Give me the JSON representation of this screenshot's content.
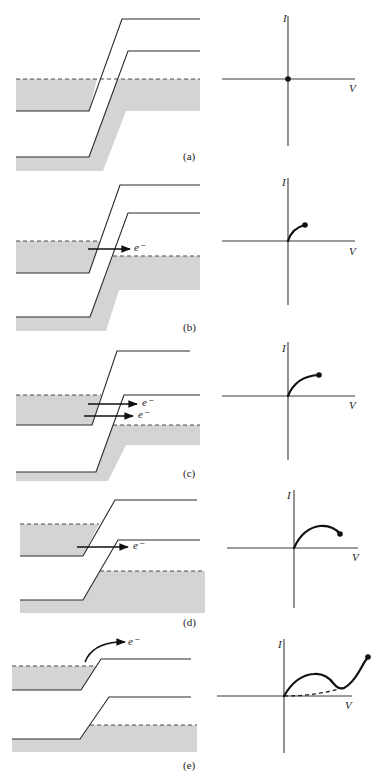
{
  "figure": {
    "axis_labels": {
      "current": "I",
      "voltage": "V"
    },
    "electron_label": "e⁻",
    "colors": {
      "filled_states": "#d4d4d4",
      "lines": "#2a2a2a",
      "curve": "#111111"
    },
    "panels": [
      {
        "label": "(a)",
        "label_pos": [
          183,
          160
        ],
        "fills": [
          "16,79 97,79 89,111 16,111",
          "117,79 200,79 200,111 126,111 103,171 16,171 16,157 89,157"
        ],
        "bands": [
          "16,111 89,111 122,19 200,19",
          "16,157 89,157 128,51 200,51"
        ],
        "fermi": [
          [
            16,
            79,
            200,
            79
          ]
        ],
        "arrows": [],
        "iv": {
          "origin": [
            288,
            79
          ],
          "ytop": 16,
          "ybot": 146,
          "xleft": 222,
          "xright": 355,
          "I_pos": [
            283,
            22
          ],
          "V_pos": [
            349,
            92
          ],
          "curve": "",
          "dot": [
            288,
            79
          ],
          "dashed": ""
        }
      },
      {
        "label": "(b)",
        "label_pos": [
          183,
          331
        ],
        "fills": [
          "16,241 100,241 89,273 16,273",
          "113,256 200,256 200,290 119,290 106,331 16,331 16,317 90,317"
        ],
        "bands": [
          "16,273 89,273 120,185 200,185",
          "16,317 90,317 128,213 200,213"
        ],
        "fermi": [
          [
            16,
            241,
            100,
            241
          ],
          [
            113,
            256,
            200,
            256
          ]
        ],
        "arrows": [
          {
            "x1": 88,
            "y1": 249,
            "x2": 130,
            "y2": 249,
            "tx": 134,
            "ty": 251
          }
        ],
        "iv": {
          "origin": [
            288,
            241
          ],
          "ytop": 178,
          "ybot": 305,
          "xleft": 222,
          "xright": 355,
          "I_pos": [
            282,
            186
          ],
          "V_pos": [
            349,
            255
          ],
          "curve": "M288,241 Q292,228 305,225",
          "dot": [
            305,
            225
          ],
          "dashed": ""
        }
      },
      {
        "label": "(c)",
        "label_pos": [
          183,
          477
        ],
        "fills": [
          "16,395 101,395 92,425 16,425",
          "113,425 200,425 200,445 126,445 108,481 16,481 16,472 96,472"
        ],
        "bands": [
          "16,425 92,425 117,351 190,351",
          "16,472 96,472 124,395 200,395"
        ],
        "fermi": [
          [
            16,
            395,
            101,
            395
          ],
          [
            113,
            425,
            200,
            425
          ]
        ],
        "arrows": [
          {
            "x1": 88,
            "y1": 404,
            "x2": 137,
            "y2": 404,
            "tx": 142,
            "ty": 406
          },
          {
            "x1": 84,
            "y1": 416,
            "x2": 133,
            "y2": 416,
            "tx": 138,
            "ty": 418
          }
        ],
        "iv": {
          "origin": [
            288,
            396
          ],
          "ytop": 342,
          "ybot": 460,
          "xleft": 222,
          "xright": 355,
          "I_pos": [
            282,
            352
          ],
          "V_pos": [
            349,
            409
          ],
          "curve": "M288,396 Q296,376 319,375",
          "dot": [
            319,
            375
          ],
          "dashed": ""
        }
      },
      {
        "label": "(d)",
        "label_pos": [
          183,
          626
        ],
        "fills": [
          "20,524 99,524 83,556 20,556",
          "100,571 205,571 205,613 20,613 20,600 83,600"
        ],
        "bands": [
          "20,556 83,556 115,500 197,500",
          "20,600 83,600 118,540 200,540"
        ],
        "fermi": [
          [
            20,
            524,
            99,
            524
          ],
          [
            100,
            571,
            205,
            571
          ]
        ],
        "arrows": [
          {
            "x1": 77,
            "y1": 547,
            "x2": 128,
            "y2": 547,
            "tx": 133,
            "ty": 549
          }
        ],
        "iv": {
          "origin": [
            294,
            548
          ],
          "ytop": 490,
          "ybot": 608,
          "xleft": 227,
          "xright": 358,
          "I_pos": [
            287,
            499
          ],
          "V_pos": [
            352,
            561
          ],
          "curve": "M294,548 Q303,528 320,526 Q333,525 340,534",
          "dot": [
            340,
            534
          ],
          "dashed": ""
        }
      },
      {
        "label": "(e)",
        "label_pos": [
          183,
          769
        ],
        "fills": [
          "12,666 96,666 81,690 12,690",
          "90,725 197,725 197,752 12,752 12,739 80,739"
        ],
        "bands": [
          "12,690 81,690 101,659 191,659",
          "12,739 80,739 109,697 191,697"
        ],
        "fermi": [
          [
            12,
            666,
            96,
            666
          ],
          [
            90,
            725,
            197,
            725
          ]
        ],
        "arrows": [
          {
            "curved": true,
            "d": "M85,662 Q92,644 118,642",
            "x2": 125,
            "y2": 642,
            "tx": 128,
            "ty": 645
          }
        ],
        "iv": {
          "origin": [
            284,
            696
          ],
          "ytop": 639,
          "ybot": 753,
          "xleft": 217,
          "xright": 352,
          "I_pos": [
            278,
            648
          ],
          "V_pos": [
            345,
            709
          ],
          "curve": "M284,696 Q296,675 314,674 Q326,673 334,684 Q339,690 344,688 Q352,684 360,670 Q364,662 368,657",
          "dot": [
            368,
            657
          ],
          "dashed": "M284,696 Q318,696 345,687"
        }
      }
    ]
  }
}
